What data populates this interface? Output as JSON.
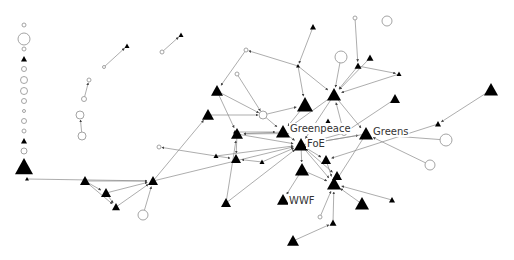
{
  "diagram": {
    "type": "directed-network",
    "labels": {
      "greenpeace": "Greenpeace",
      "foe": "FoE",
      "greens": "Greens",
      "wwf": "WWF"
    },
    "colors": {
      "background": "#ffffff",
      "edge": "#8a8a8a",
      "triangle_node": "#000000",
      "circle_node_stroke": "#9a9a9a"
    },
    "nodes": [
      {
        "id": "iso1",
        "shape": "circle",
        "x": 24,
        "y": 25,
        "r": 2
      },
      {
        "id": "iso2",
        "shape": "circle",
        "x": 24,
        "y": 39,
        "r": 6
      },
      {
        "id": "iso3",
        "shape": "circle",
        "x": 24,
        "y": 49,
        "r": 2
      },
      {
        "id": "iso4",
        "shape": "triangle",
        "x": 24,
        "y": 59,
        "s": 3
      },
      {
        "id": "iso5",
        "shape": "circle",
        "x": 24,
        "y": 69,
        "r": 2.5
      },
      {
        "id": "iso6",
        "shape": "circle",
        "x": 24,
        "y": 80,
        "r": 3.5
      },
      {
        "id": "iso7",
        "shape": "circle",
        "x": 24,
        "y": 91,
        "r": 3.5
      },
      {
        "id": "iso8",
        "shape": "circle",
        "x": 24,
        "y": 101,
        "r": 2.5
      },
      {
        "id": "iso9",
        "shape": "circle",
        "x": 24,
        "y": 111,
        "r": 1.5
      },
      {
        "id": "iso10",
        "shape": "circle",
        "x": 24,
        "y": 121,
        "r": 2.5
      },
      {
        "id": "iso11",
        "shape": "circle",
        "x": 24,
        "y": 131,
        "r": 2
      },
      {
        "id": "iso12",
        "shape": "triangle",
        "x": 24,
        "y": 141,
        "s": 3
      },
      {
        "id": "iso13",
        "shape": "circle",
        "x": 24,
        "y": 151,
        "r": 3
      },
      {
        "id": "iso14",
        "shape": "triangle",
        "x": 24,
        "y": 167,
        "s": 9
      },
      {
        "id": "p1a",
        "shape": "circle",
        "x": 104,
        "y": 67,
        "r": 1.5
      },
      {
        "id": "p1b",
        "shape": "triangle",
        "x": 127,
        "y": 46,
        "s": 2.5
      },
      {
        "id": "p2a",
        "shape": "circle",
        "x": 162,
        "y": 52,
        "r": 2
      },
      {
        "id": "p2b",
        "shape": "triangle",
        "x": 181,
        "y": 35,
        "s": 2.5
      },
      {
        "id": "p3a",
        "shape": "circle",
        "x": 89,
        "y": 80,
        "r": 2
      },
      {
        "id": "p3b",
        "shape": "circle",
        "x": 84,
        "y": 99,
        "r": 2.5
      },
      {
        "id": "p4a",
        "shape": "circle",
        "x": 80,
        "y": 115,
        "r": 4
      },
      {
        "id": "p4b",
        "shape": "circle",
        "x": 82,
        "y": 136,
        "r": 4
      },
      {
        "id": "w0",
        "shape": "triangle",
        "x": 27,
        "y": 179,
        "s": 2
      },
      {
        "id": "w1",
        "shape": "triangle",
        "x": 85,
        "y": 181,
        "s": 5
      },
      {
        "id": "w2",
        "shape": "triangle",
        "x": 106,
        "y": 193,
        "s": 5
      },
      {
        "id": "w3",
        "shape": "triangle",
        "x": 116,
        "y": 207,
        "s": 4
      },
      {
        "id": "w4",
        "shape": "triangle",
        "x": 153,
        "y": 181,
        "s": 5
      },
      {
        "id": "w5",
        "shape": "circle",
        "x": 143,
        "y": 215,
        "r": 5
      },
      {
        "id": "c_top",
        "shape": "triangle",
        "x": 313,
        "y": 27,
        "s": 3
      },
      {
        "id": "c_o1",
        "shape": "circle",
        "x": 246,
        "y": 50,
        "r": 2
      },
      {
        "id": "c_j1",
        "shape": "triangle",
        "x": 298,
        "y": 66,
        "s": 2
      },
      {
        "id": "c_o2",
        "shape": "circle",
        "x": 237,
        "y": 74,
        "r": 2
      },
      {
        "id": "c_b1",
        "shape": "triangle",
        "x": 217,
        "y": 91,
        "s": 6
      },
      {
        "id": "c_b2",
        "shape": "triangle",
        "x": 208,
        "y": 115,
        "s": 6
      },
      {
        "id": "c_o3",
        "shape": "circle",
        "x": 263,
        "y": 115,
        "r": 4
      },
      {
        "id": "c_b3",
        "shape": "triangle",
        "x": 305,
        "y": 105,
        "s": 8
      },
      {
        "id": "c_big_o",
        "shape": "circle",
        "x": 341,
        "y": 57,
        "r": 6
      },
      {
        "id": "c_hub2",
        "shape": "triangle",
        "x": 334,
        "y": 95,
        "s": 7
      },
      {
        "id": "c_s1",
        "shape": "triangle",
        "x": 328,
        "y": 122,
        "s": 3.5
      },
      {
        "id": "c_top2",
        "shape": "circle",
        "x": 355,
        "y": 18,
        "r": 2
      },
      {
        "id": "c_t3",
        "shape": "triangle",
        "x": 370,
        "y": 58,
        "s": 3.5
      },
      {
        "id": "c_t4",
        "shape": "triangle",
        "x": 358,
        "y": 66,
        "s": 3.5
      },
      {
        "id": "c_t5",
        "shape": "triangle",
        "x": 399,
        "y": 74,
        "s": 2.5
      },
      {
        "id": "c_t6",
        "shape": "triangle",
        "x": 395,
        "y": 99,
        "s": 5
      },
      {
        "id": "c_big_o2",
        "shape": "circle",
        "x": 387,
        "y": 21,
        "r": 5
      },
      {
        "id": "greenpeace",
        "shape": "triangle",
        "x": 283,
        "y": 132,
        "s": 7
      },
      {
        "id": "foe",
        "shape": "triangle",
        "x": 301,
        "y": 145,
        "s": 7
      },
      {
        "id": "greens",
        "shape": "triangle",
        "x": 366,
        "y": 134,
        "s": 7
      },
      {
        "id": "c_oj",
        "shape": "circle",
        "x": 344,
        "y": 133,
        "r": 2.5
      },
      {
        "id": "c_l1",
        "shape": "triangle",
        "x": 237,
        "y": 134,
        "s": 6
      },
      {
        "id": "c_l2",
        "shape": "triangle",
        "x": 236,
        "y": 159,
        "s": 5
      },
      {
        "id": "c_l3",
        "shape": "triangle",
        "x": 216,
        "y": 156,
        "s": 2.5
      },
      {
        "id": "c_l4",
        "shape": "triangle",
        "x": 262,
        "y": 162,
        "s": 2.5
      },
      {
        "id": "c_m1",
        "shape": "triangle",
        "x": 326,
        "y": 160,
        "s": 5
      },
      {
        "id": "c_m2",
        "shape": "triangle",
        "x": 302,
        "y": 170,
        "s": 7
      },
      {
        "id": "c_m3",
        "shape": "triangle",
        "x": 337,
        "y": 176,
        "s": 5
      },
      {
        "id": "c_m4",
        "shape": "triangle",
        "x": 334,
        "y": 184,
        "s": 7
      },
      {
        "id": "c_old",
        "shape": "circle",
        "x": 159,
        "y": 147,
        "r": 2
      },
      {
        "id": "c_oright",
        "shape": "circle",
        "x": 446,
        "y": 140,
        "r": 6
      },
      {
        "id": "c_oright2",
        "shape": "circle",
        "x": 430,
        "y": 165,
        "r": 5
      },
      {
        "id": "c_far",
        "shape": "triangle",
        "x": 491,
        "y": 90,
        "s": 7
      },
      {
        "id": "c_far2",
        "shape": "triangle",
        "x": 438,
        "y": 124,
        "s": 3
      },
      {
        "id": "wwf",
        "shape": "triangle",
        "x": 283,
        "y": 200,
        "s": 6
      },
      {
        "id": "c_bl",
        "shape": "triangle",
        "x": 226,
        "y": 203,
        "s": 5
      },
      {
        "id": "c_br1",
        "shape": "triangle",
        "x": 362,
        "y": 204,
        "s": 7
      },
      {
        "id": "c_br2",
        "shape": "triangle",
        "x": 392,
        "y": 200,
        "s": 3
      },
      {
        "id": "c_bo",
        "shape": "circle",
        "x": 320,
        "y": 217,
        "r": 2
      },
      {
        "id": "c_bm",
        "shape": "triangle",
        "x": 333,
        "y": 223,
        "s": 3.5
      },
      {
        "id": "c_bb",
        "shape": "triangle",
        "x": 293,
        "y": 241,
        "s": 6
      },
      {
        "id": "c_ring1",
        "shape": "triangle",
        "x": 235,
        "y": 132,
        "s": 2
      }
    ],
    "edges": [
      [
        "p1a",
        "p1b"
      ],
      [
        "p2a",
        "p2b"
      ],
      [
        "p3b",
        "p3a"
      ],
      [
        "p4b",
        "p4a"
      ],
      [
        "w0",
        "w4"
      ],
      [
        "w1",
        "w4"
      ],
      [
        "w1",
        "w2"
      ],
      [
        "w2",
        "w3"
      ],
      [
        "w2",
        "w4"
      ],
      [
        "w3",
        "w4"
      ],
      [
        "w5",
        "w4"
      ],
      [
        "w1",
        "w3"
      ],
      [
        "w4",
        "c_b2"
      ],
      [
        "w4",
        "foe"
      ],
      [
        "c_top",
        "c_j1"
      ],
      [
        "c_j1",
        "c_o1"
      ],
      [
        "c_o1",
        "c_b1"
      ],
      [
        "c_j1",
        "c_b3"
      ],
      [
        "c_j1",
        "c_hub2"
      ],
      [
        "c_o2",
        "c_o3"
      ],
      [
        "c_b1",
        "c_o3"
      ],
      [
        "c_b1",
        "c_l1"
      ],
      [
        "c_b2",
        "c_o3"
      ],
      [
        "c_o3",
        "c_b3"
      ],
      [
        "c_o3",
        "greenpeace"
      ],
      [
        "c_big_o",
        "c_hub2"
      ],
      [
        "c_top2",
        "c_t4"
      ],
      [
        "c_t4",
        "c_hub2"
      ],
      [
        "c_t4",
        "c_t5"
      ],
      [
        "c_t5",
        "c_hub2"
      ],
      [
        "c_t3",
        "c_hub2"
      ],
      [
        "c_t6",
        "c_oj"
      ],
      [
        "c_oj",
        "c_hub2"
      ],
      [
        "c_oj",
        "c_s1"
      ],
      [
        "c_oj",
        "c_l1"
      ],
      [
        "c_oj",
        "foe"
      ],
      [
        "c_b3",
        "greenpeace"
      ],
      [
        "c_hub2",
        "foe"
      ],
      [
        "c_hub2",
        "greenpeace"
      ],
      [
        "c_hub2",
        "greens"
      ],
      [
        "greenpeace",
        "foe"
      ],
      [
        "foe",
        "greens"
      ],
      [
        "greens",
        "foe"
      ],
      [
        "c_oright",
        "greens"
      ],
      [
        "c_oright2",
        "greens"
      ],
      [
        "c_far",
        "c_far2"
      ],
      [
        "c_far2",
        "c_m1"
      ],
      [
        "c_l1",
        "c_l2"
      ],
      [
        "c_l1",
        "foe"
      ],
      [
        "c_l3",
        "c_l2"
      ],
      [
        "c_l3",
        "foe"
      ],
      [
        "c_l3",
        "c_old"
      ],
      [
        "c_l4",
        "c_l2"
      ],
      [
        "c_l4",
        "foe"
      ],
      [
        "foe",
        "c_m1"
      ],
      [
        "foe",
        "c_m2"
      ],
      [
        "foe",
        "c_m4"
      ],
      [
        "foe",
        "c_m3"
      ],
      [
        "greens",
        "c_m4"
      ],
      [
        "c_m1",
        "c_m4"
      ],
      [
        "c_m2",
        "wwf"
      ],
      [
        "c_m2",
        "c_m4"
      ],
      [
        "c_bl",
        "foe"
      ],
      [
        "c_bl",
        "c_l1"
      ],
      [
        "c_br1",
        "c_m4"
      ],
      [
        "c_br2",
        "c_m4"
      ],
      [
        "c_bo",
        "c_m4"
      ],
      [
        "c_bm",
        "c_m4"
      ],
      [
        "c_bb",
        "c_bm"
      ],
      [
        "greenpeace",
        "c_l1"
      ],
      [
        "c_ring1",
        "greenpeace"
      ]
    ]
  }
}
